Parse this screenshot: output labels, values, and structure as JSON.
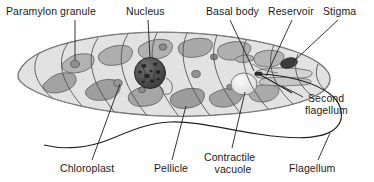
{
  "diagram": {
    "style": {
      "background": "#ffffff",
      "ink": "#1a1a1a",
      "body_fill": "#dedede",
      "body_edge": "#6d6d6d",
      "chloroplast_fill": "#a9a9a9",
      "chloroplast_edge": "#5f5f5f",
      "nucleus_fill": "#4f4f4f",
      "nucleus_edge": "#2b2b2b",
      "granule_fill": "#9a9a9a",
      "stigma_fill": "#3d3d3d",
      "vacuole_fill": "#ededed",
      "reservoir_fill": "#cfcfcf",
      "pellicle_line": "#545454",
      "leader_line": "#1f1f1f"
    },
    "labels": [
      {
        "id": "paramylon-granule",
        "text": "Paramylon granule",
        "lines": [
          "Paramylon granule"
        ],
        "x": 6,
        "y": 6,
        "align": "left"
      },
      {
        "id": "nucleus",
        "text": "Nucleus",
        "lines": [
          "Nucleus"
        ],
        "x": 126,
        "y": 6,
        "align": "left"
      },
      {
        "id": "basal-body",
        "text": "Basal body",
        "lines": [
          "Basal body"
        ],
        "x": 206,
        "y": 6,
        "align": "left"
      },
      {
        "id": "reservoir",
        "text": "Reservoir",
        "lines": [
          "Reservoir"
        ],
        "x": 268,
        "y": 6,
        "align": "left"
      },
      {
        "id": "stigma",
        "text": "Stigma",
        "lines": [
          "Stigma"
        ],
        "x": 323,
        "y": 6,
        "align": "left"
      },
      {
        "id": "second-flagellum",
        "text": "Second flagellum",
        "lines": [
          "Second",
          "flagellum"
        ],
        "x": 305,
        "y": 93,
        "align": "left"
      },
      {
        "id": "chloroplast",
        "text": "Chloroplast",
        "lines": [
          "Chloroplast"
        ],
        "x": 60,
        "y": 163,
        "align": "left"
      },
      {
        "id": "pellicle",
        "text": "Pellicle",
        "lines": [
          "Pellicle"
        ],
        "x": 154,
        "y": 163,
        "align": "left"
      },
      {
        "id": "contractile-vacuole",
        "text": "Contractile vacuole",
        "lines": [
          "Contractile",
          "vacuole"
        ],
        "x": 204,
        "y": 152,
        "align": "left"
      },
      {
        "id": "flagellum",
        "text": "Flagellum",
        "lines": [
          "Flagellum"
        ],
        "x": 289,
        "y": 163,
        "align": "left"
      }
    ],
    "structures": [
      {
        "id": "cell-body",
        "name": "euglena-cell-body"
      },
      {
        "id": "pellicle-striations",
        "name": "pellicle-striations",
        "count": 11
      },
      {
        "id": "chloroplasts",
        "name": "chloroplast-group",
        "count": 12
      },
      {
        "id": "nucleus-organelle",
        "name": "nucleus-organelle"
      },
      {
        "id": "paramylon-granules",
        "name": "paramylon-granule-group",
        "count": 7
      },
      {
        "id": "stigma-organelle",
        "name": "stigma-eyespot"
      },
      {
        "id": "reservoir-organelle",
        "name": "reservoir-cavity"
      },
      {
        "id": "contractile-vacuole-organelle",
        "name": "contractile-vacuole"
      },
      {
        "id": "basal-body-organelle",
        "name": "basal-body"
      },
      {
        "id": "flagellum-long",
        "name": "long-flagellum"
      },
      {
        "id": "flagellum-short",
        "name": "second-flagellum-stub"
      }
    ]
  }
}
